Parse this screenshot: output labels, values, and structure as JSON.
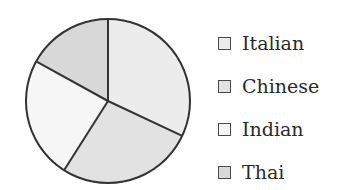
{
  "chart_data": {
    "type": "pie",
    "title": "",
    "categories": [
      "Italian",
      "Chinese",
      "Indian",
      "Thai"
    ],
    "values": [
      32,
      27,
      24,
      17
    ],
    "colors": [
      "#ececec",
      "#e2e2e2",
      "#f6f6f6",
      "#d8d8d8"
    ],
    "start_angle_deg": 90,
    "direction": "clockwise",
    "legend_position": "right"
  },
  "legend": {
    "items": [
      {
        "label": "Italian",
        "color": "#ececec"
      },
      {
        "label": "Chinese",
        "color": "#e2e2e2"
      },
      {
        "label": "Indian",
        "color": "#f6f6f6"
      },
      {
        "label": "Thai",
        "color": "#d8d8d8"
      }
    ]
  }
}
